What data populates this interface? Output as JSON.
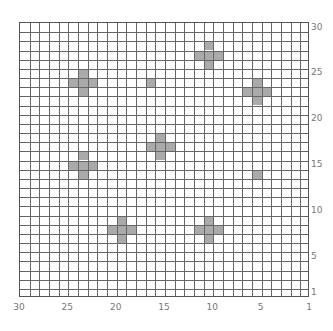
{
  "grid": {
    "columns": 30,
    "rows": 30,
    "x_axis_direction": "right-to-left",
    "y_axis_direction": "bottom-to-top",
    "shade_color": "#aaaaaa",
    "line_color": "#666666"
  },
  "x_labels": [
    {
      "value": 30,
      "text": "30"
    },
    {
      "value": 25,
      "text": "25"
    },
    {
      "value": 20,
      "text": "20"
    },
    {
      "value": 15,
      "text": "15"
    },
    {
      "value": 10,
      "text": "10"
    },
    {
      "value": 5,
      "text": "5"
    },
    {
      "value": 1,
      "text": "1"
    }
  ],
  "y_labels": [
    {
      "value": 30,
      "text": "30"
    },
    {
      "value": 25,
      "text": "25"
    },
    {
      "value": 20,
      "text": "20"
    },
    {
      "value": 15,
      "text": "15"
    },
    {
      "value": 10,
      "text": "10"
    },
    {
      "value": 5,
      "text": "5"
    },
    {
      "value": 1,
      "text": "1"
    }
  ],
  "shapes": [
    {
      "type": "plus",
      "center": [
        11,
        27
      ]
    },
    {
      "type": "plus",
      "center": [
        24,
        24
      ]
    },
    {
      "type": "single",
      "center": [
        17,
        24
      ]
    },
    {
      "type": "plus",
      "center": [
        6,
        23
      ]
    },
    {
      "type": "plus",
      "center": [
        16,
        17
      ]
    },
    {
      "type": "plus",
      "center": [
        24,
        15
      ]
    },
    {
      "type": "single",
      "center": [
        6,
        14
      ]
    },
    {
      "type": "plus",
      "center": [
        20,
        8
      ]
    },
    {
      "type": "plus",
      "center": [
        11,
        8
      ]
    }
  ]
}
